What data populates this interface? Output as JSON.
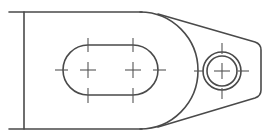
{
  "drawing": {
    "type": "technical-drawing",
    "view": "top view of lever / link part",
    "line_color": "#4a4a4a",
    "centerline_color": "#555555",
    "background": "#ffffff",
    "features": [
      {
        "name": "base-body",
        "description": "rectangular body with left edge line"
      },
      {
        "name": "large-end-arc",
        "center": [
          140,
          70
        ],
        "radius": 58
      },
      {
        "name": "slot",
        "left_center": [
          88,
          70
        ],
        "right_center": [
          133,
          70
        ],
        "radius": 25
      },
      {
        "name": "hole-outer",
        "center": [
          222,
          71
        ],
        "radius": 19
      },
      {
        "name": "hole-inner",
        "center": [
          222,
          71
        ],
        "radius": 15
      },
      {
        "name": "tapered-tab",
        "end_x": 261
      }
    ]
  }
}
